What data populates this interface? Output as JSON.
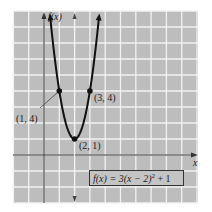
{
  "chart_data": {
    "type": "line",
    "title": "",
    "xlabel": "x",
    "ylabel": "f(x)",
    "function": "f(x) = 3(x − 2)² + 1",
    "equation_label": {
      "prefix": "f(x) = 3(x − 2)",
      "exponent": "2",
      "suffix": " + 1"
    },
    "axis_of_symmetry": {
      "x": 2,
      "style": "dashed"
    },
    "xlim": [
      -2,
      10
    ],
    "ylim": [
      -3,
      9
    ],
    "grid": true,
    "highlighted_points": [
      {
        "x": 1,
        "y": 4,
        "label": "(1, 4)"
      },
      {
        "x": 3,
        "y": 4,
        "label": "(3, 4)"
      },
      {
        "x": 2,
        "y": 1,
        "label": "(2, 1)"
      }
    ],
    "series": [
      {
        "name": "f(x)",
        "x": [
          0.77,
          1,
          1.25,
          1.5,
          1.75,
          2,
          2.25,
          2.5,
          2.75,
          3,
          3.23
        ],
        "y": [
          5.54,
          4,
          2.69,
          1.75,
          1.19,
          1,
          1.19,
          1.75,
          2.69,
          4,
          5.54
        ]
      }
    ]
  },
  "colors": {
    "grid_background": "#bdbdbd",
    "grid_lines": "#f2f2f2",
    "curve": "#111111",
    "axis": "#333333"
  }
}
